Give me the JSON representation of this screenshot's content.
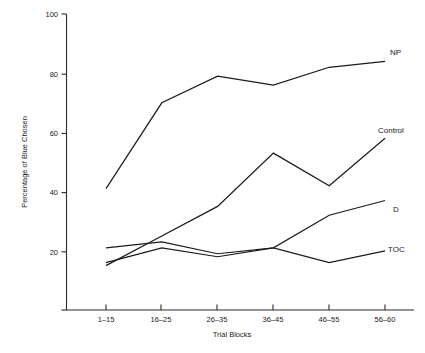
{
  "chart_data": {
    "type": "line",
    "title": "",
    "xlabel": "Trial Blocks",
    "ylabel": "Percentage of Blue Chosen",
    "categories": [
      "1–15",
      "16–25",
      "26–35",
      "36–45",
      "46–55",
      "56–60"
    ],
    "ylim": [
      0,
      100
    ],
    "yticks": [
      20,
      40,
      60,
      80,
      100
    ],
    "ytick_labels": [
      "20",
      "40",
      "60",
      "80",
      "100"
    ],
    "grid": false,
    "legend_position": "right-inline-labels",
    "series": [
      {
        "name": "NP",
        "values": [
          41,
          70,
          79,
          76,
          82,
          84
        ]
      },
      {
        "name": "Control",
        "values": [
          15,
          25,
          35,
          53,
          42,
          58
        ]
      },
      {
        "name": "D",
        "values": [
          21,
          23,
          19,
          21,
          32,
          37
        ]
      },
      {
        "name": "TOC",
        "values": [
          16,
          21,
          18,
          21,
          16,
          20
        ]
      }
    ],
    "line_color": "#1a1a1a",
    "axis_color": "#2b2b2b",
    "background": "#ffffff"
  },
  "axis_titles": {
    "x": "Trial Blocks",
    "y": "Percentage of Blue Chosen"
  },
  "series_labels": {
    "np": "NP",
    "control": "Control",
    "d": "D",
    "toc": "TOC"
  },
  "ytick_labels": {
    "t20": "20",
    "t40": "40",
    "t60": "60",
    "t80": "80",
    "t100": "100"
  },
  "xtick_labels": {
    "b1": "1–15",
    "b2": "16–25",
    "b3": "26–35",
    "b4": "36–45",
    "b5": "46–55",
    "b6": "56–60"
  }
}
